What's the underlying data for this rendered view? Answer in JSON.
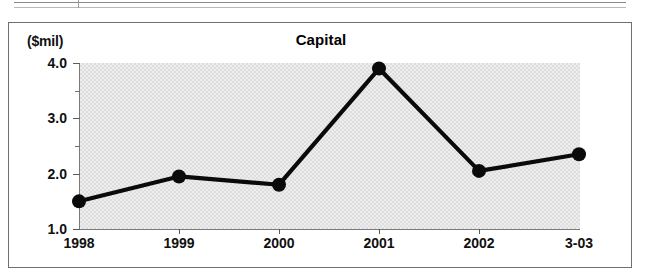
{
  "scan_fragment": {
    "name": "table-rule-fragment",
    "rules": [
      {
        "type": "h",
        "x": 14,
        "y": 2,
        "w": 612,
        "faint": false
      },
      {
        "type": "h",
        "x": 14,
        "y": 7,
        "w": 612,
        "faint": true
      },
      {
        "type": "v",
        "x": 78,
        "y": 0,
        "h": 8
      }
    ]
  },
  "chart": {
    "title": "Capital",
    "axis_unit_label": "($mil)"
  },
  "chart_data": {
    "type": "line",
    "title": "Capital",
    "xlabel": "",
    "ylabel": "($mil)",
    "unit": "$mil",
    "categories": [
      "1998",
      "1999",
      "2000",
      "2001",
      "2002",
      "3-03"
    ],
    "values": [
      1.5,
      1.95,
      1.8,
      3.9,
      2.05,
      2.35
    ],
    "series": [
      {
        "name": "Capital",
        "values": [
          1.5,
          1.95,
          1.8,
          3.9,
          2.05,
          2.35
        ]
      }
    ],
    "ylim": [
      1.0,
      4.0
    ],
    "ytick_labels": [
      "4.0",
      "3.0",
      "2.0",
      "1.0"
    ],
    "ytick_values": [
      4.0,
      3.0,
      2.0,
      1.0
    ],
    "yminor_tick_values": [
      3.5,
      2.5,
      1.5
    ],
    "grid": false,
    "legend": "none",
    "marker": "filled-circle",
    "line_color": "#0a0a0a",
    "plot_background": "#e0e0e0"
  }
}
